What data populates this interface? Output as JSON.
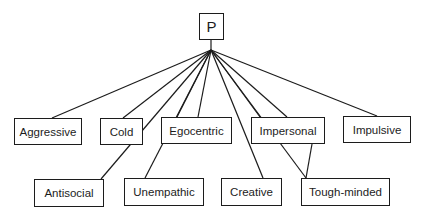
{
  "diagram": {
    "type": "tree",
    "root": {
      "id": "P",
      "label": "P",
      "box": [
        199,
        13,
        25,
        27
      ]
    },
    "hub": [
      211,
      50
    ],
    "line_color": "#1c1c1c",
    "nodes": [
      {
        "id": "aggressive",
        "label": "Aggressive",
        "box": [
          14,
          118,
          68,
          27
        ],
        "anchor": [
          52,
          118
        ]
      },
      {
        "id": "cold",
        "label": "Cold",
        "box": [
          100,
          118,
          43,
          27
        ],
        "anchor": [
          123,
          118
        ]
      },
      {
        "id": "egocentric",
        "label": "Egocentric",
        "box": [
          161,
          117,
          71,
          27
        ],
        "anchor": [
          177,
          117
        ],
        "anchor2": [
          198,
          117
        ]
      },
      {
        "id": "impersonal",
        "label": "Impersonal",
        "box": [
          251,
          117,
          74,
          27
        ],
        "anchor": [
          260,
          117
        ]
      },
      {
        "id": "impulsive",
        "label": "Impulsive",
        "box": [
          343,
          116,
          68,
          27
        ],
        "anchor": [
          377,
          116
        ]
      },
      {
        "id": "antisocial",
        "label": "Antisocial",
        "box": [
          34,
          179,
          70,
          28
        ],
        "anchor": [
          101,
          179
        ]
      },
      {
        "id": "unempathic",
        "label": "Unempathic",
        "box": [
          124,
          178,
          80,
          28
        ],
        "anchor": [
          145,
          178
        ],
        "from": [
          163,
          144
        ]
      },
      {
        "id": "creative",
        "label": "Creative",
        "box": [
          221,
          178,
          61,
          28
        ],
        "anchor": [
          263,
          178
        ]
      },
      {
        "id": "tough-minded",
        "label": "Tough-minded",
        "box": [
          301,
          178,
          89,
          28
        ],
        "anchor": [
          306,
          178
        ]
      }
    ]
  }
}
